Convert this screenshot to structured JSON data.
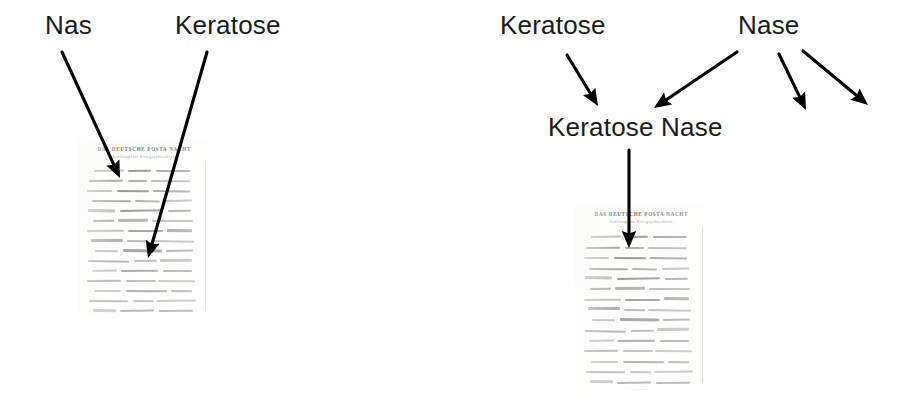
{
  "figure": {
    "type": "annotation-diagram",
    "background_color": "#ffffff",
    "text_color": "#1a1a1a",
    "arrow_color": "#000000"
  },
  "panels": [
    {
      "id": "left",
      "name": "left-panel",
      "labels": [
        {
          "id": "nas",
          "text": "Nas",
          "x": 45,
          "y": 10
        },
        {
          "id": "keratose",
          "text": "Keratose",
          "x": 175,
          "y": 10
        }
      ],
      "arrows": [
        {
          "id": "nas-arrow",
          "from_label": "Nas",
          "x1": 62,
          "y1": 52,
          "x2": 120,
          "y2": 178
        },
        {
          "id": "keratose-arrow",
          "from_label": "Keratose",
          "x1": 207,
          "y1": 52,
          "x2": 148,
          "y2": 258
        }
      ],
      "document": {
        "id": "manuscript-left",
        "x": 78,
        "y": 140,
        "width": 130,
        "height": 178,
        "header_line1": "DAS DEUTSCHE POSTA NACHT",
        "header_line2": "Schlossplatz  Kriegsjahresblatt",
        "line_count": 22
      }
    },
    {
      "id": "right",
      "name": "right-panel",
      "labels": [
        {
          "id": "keratose-r",
          "text": "Keratose",
          "x": 500,
          "y": 10
        },
        {
          "id": "nase-r",
          "text": "Nase",
          "x": 738,
          "y": 10
        },
        {
          "id": "keratose-nase",
          "text": "Keratose Nase",
          "x": 548,
          "y": 112
        }
      ],
      "arrows": [
        {
          "id": "keratose-to-merge",
          "from_label": "Keratose",
          "x1": 567,
          "y1": 55,
          "x2": 598,
          "y2": 106
        },
        {
          "id": "nase-to-merge",
          "from_label": "Nase",
          "x1": 737,
          "y1": 52,
          "x2": 654,
          "y2": 108
        },
        {
          "id": "nase-spare-1",
          "from_label": "Nase",
          "x1": 779,
          "y1": 54,
          "x2": 806,
          "y2": 110
        },
        {
          "id": "nase-spare-2",
          "from_label": "Nase",
          "x1": 803,
          "y1": 51,
          "x2": 868,
          "y2": 105
        },
        {
          "id": "merge-to-doc",
          "from_label": "Keratose Nase",
          "x1": 629,
          "y1": 150,
          "x2": 629,
          "y2": 248
        }
      ],
      "document": {
        "id": "manuscript-right",
        "x": 575,
        "y": 205,
        "width": 130,
        "height": 185,
        "header_line1": "DAS DEUTSCHE POSTA NACHT",
        "header_line2": "Schlossplatz  Kriegsjahresblatt",
        "line_count": 22
      }
    }
  ],
  "manuscript_lines": [
    [
      [
        6,
        26
      ],
      [
        36,
        20
      ],
      [
        60,
        30
      ]
    ],
    [
      [
        2,
        30
      ],
      [
        36,
        16
      ],
      [
        56,
        34
      ]
    ],
    [
      [
        0,
        22
      ],
      [
        26,
        28
      ],
      [
        58,
        32
      ]
    ],
    [
      [
        4,
        34
      ],
      [
        42,
        22
      ],
      [
        68,
        24
      ]
    ],
    [
      [
        1,
        24
      ],
      [
        29,
        38
      ],
      [
        71,
        20
      ]
    ],
    [
      [
        5,
        18
      ],
      [
        27,
        26
      ],
      [
        57,
        36
      ]
    ],
    [
      [
        0,
        32
      ],
      [
        36,
        30
      ],
      [
        70,
        22
      ]
    ],
    [
      [
        3,
        28
      ],
      [
        35,
        18
      ],
      [
        56,
        38
      ]
    ],
    [
      [
        7,
        20
      ],
      [
        31,
        34
      ],
      [
        69,
        24
      ]
    ],
    [
      [
        1,
        36
      ],
      [
        41,
        20
      ],
      [
        64,
        28
      ]
    ],
    [
      [
        4,
        22
      ],
      [
        30,
        32
      ],
      [
        66,
        26
      ]
    ],
    [
      [
        0,
        30
      ],
      [
        34,
        26
      ],
      [
        62,
        32
      ]
    ],
    [
      [
        6,
        24
      ],
      [
        34,
        36
      ],
      [
        73,
        18
      ]
    ],
    [
      [
        2,
        34
      ],
      [
        40,
        18
      ],
      [
        61,
        34
      ]
    ],
    [
      [
        5,
        20
      ],
      [
        29,
        30
      ],
      [
        63,
        30
      ]
    ],
    [
      [
        1,
        28
      ],
      [
        33,
        24
      ],
      [
        60,
        36
      ]
    ],
    [
      [
        3,
        32
      ],
      [
        39,
        28
      ],
      [
        70,
        20
      ]
    ],
    [
      [
        0,
        26
      ],
      [
        30,
        34
      ],
      [
        67,
        25
      ]
    ],
    [
      [
        6,
        30
      ],
      [
        40,
        22
      ],
      [
        65,
        28
      ]
    ],
    [
      [
        2,
        22
      ],
      [
        28,
        32
      ],
      [
        63,
        32
      ]
    ],
    [
      [
        4,
        28
      ],
      [
        36,
        26
      ],
      [
        66,
        24
      ]
    ],
    [
      [
        1,
        24
      ],
      [
        31,
        20
      ],
      [
        55,
        18
      ]
    ]
  ]
}
